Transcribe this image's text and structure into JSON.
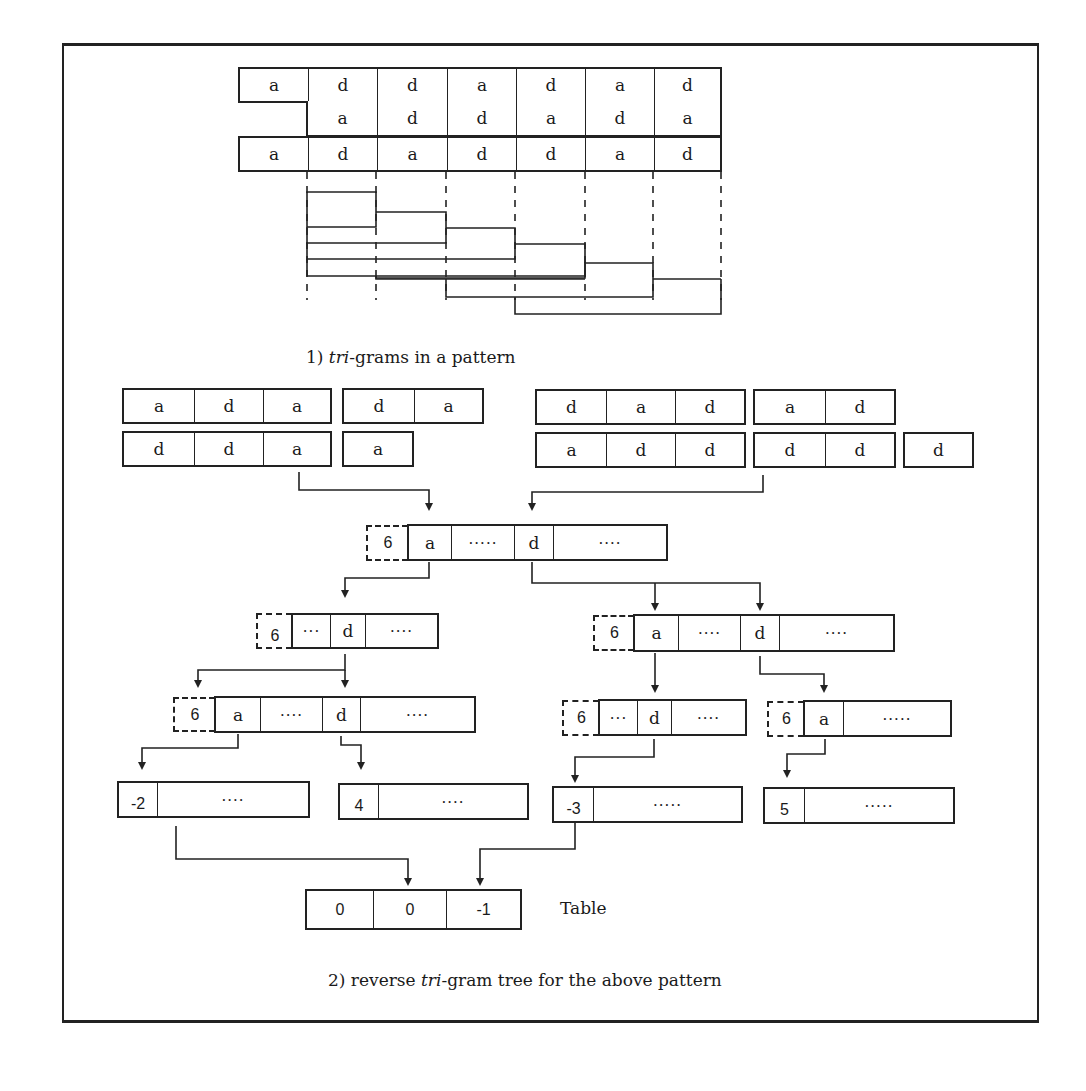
{
  "figure": {
    "part1": {
      "pattern_rows": [
        [
          "a",
          "d",
          "d",
          "a",
          "d",
          "a",
          "d"
        ],
        [
          "",
          "a",
          "d",
          "d",
          "a",
          "d",
          "a"
        ],
        [
          "a",
          "d",
          "a",
          "d",
          "d",
          "a",
          "d"
        ]
      ],
      "caption_prefix": "1) ",
      "caption_italic": "tri",
      "caption_suffix": "-grams in a pattern"
    },
    "part2": {
      "left_groups": {
        "row1_triple": [
          "a",
          "d",
          "a"
        ],
        "row1_pair": [
          "d",
          "a"
        ],
        "row2_triple": [
          "d",
          "d",
          "a"
        ],
        "row2_single": [
          "a"
        ]
      },
      "right_groups": {
        "row1_triple": [
          "d",
          "a",
          "d"
        ],
        "row1_pair": [
          "a",
          "d"
        ],
        "row2_triple": [
          "a",
          "d",
          "d"
        ],
        "row2_pair": [
          "d",
          "d"
        ],
        "row2_single": [
          "d"
        ]
      },
      "root_node": {
        "count": "6",
        "cells": [
          "a",
          "·····",
          "d",
          "····"
        ]
      },
      "level2_left": {
        "count": "6",
        "cells": [
          "···",
          "d",
          "····"
        ]
      },
      "level2_right": {
        "count": "6",
        "cells": [
          "a",
          "····",
          "d",
          "····"
        ]
      },
      "level3_left": {
        "count": "6",
        "cells": [
          "a",
          "····",
          "d",
          "····"
        ]
      },
      "level3_mid": {
        "count": "6",
        "cells": [
          "···",
          "d",
          "····"
        ]
      },
      "level3_right": {
        "count": "6",
        "cells": [
          "a",
          "·····"
        ]
      },
      "leaves": [
        {
          "value": "-2",
          "rest": "····"
        },
        {
          "value": "4",
          "rest": "····"
        },
        {
          "value": "-3",
          "rest": "·····"
        },
        {
          "value": "5",
          "rest": "·····"
        }
      ],
      "table": {
        "cells": [
          "0",
          "0",
          "-1"
        ],
        "label": "Table"
      },
      "caption_prefix": "2) reverse ",
      "caption_italic": "tri",
      "caption_suffix": "-gram tree for the above pattern"
    }
  }
}
